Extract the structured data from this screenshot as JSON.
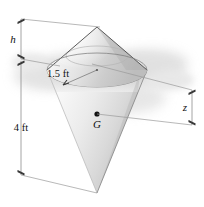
{
  "figure": {
    "labels": {
      "height_upper": "h",
      "radius": "1.5 ft",
      "height_lower": "4 ft",
      "centroid_height": "z",
      "centroid_point": "G"
    },
    "colors": {
      "outline_dark": "#4a4a4a",
      "outline_mid": "#7d7d7d",
      "dimension_line": "#8e8e8e",
      "tick": "#3a3a3a",
      "shadow": "#c9c9c9",
      "surface_light": "#f2f2f2",
      "surface_mid": "#d8d8d8",
      "surface_dark": "#b8b8b8",
      "background": "#ffffff",
      "text": "#101010"
    },
    "geometry": {
      "apex_top": "97,27",
      "rim_center": "97,70",
      "rim_radius_x": "50",
      "rim_radius_y": "17",
      "apex_bottom": "97,193",
      "centroid": "97,118"
    }
  }
}
